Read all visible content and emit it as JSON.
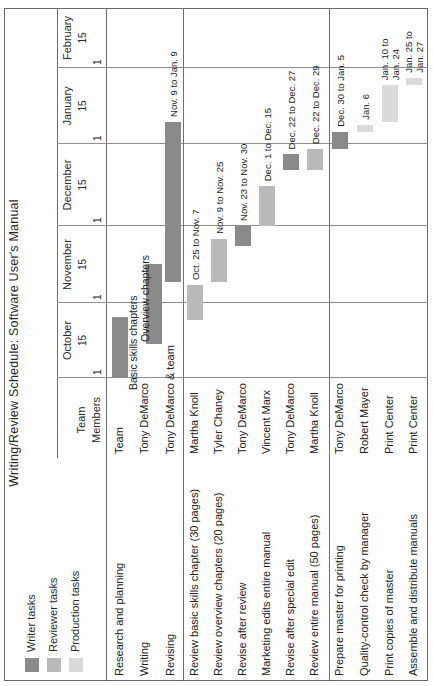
{
  "chart_data": {
    "type": "bar",
    "variant": "rotated-gantt",
    "orientation": "page rotated 90 degrees counterclockwise",
    "title": "Writing/Review Schedule: Software User's Manual",
    "legend": [
      {
        "label": "Writer tasks",
        "type": "writer"
      },
      {
        "label": "Reviewer tasks",
        "type": "reviewer"
      },
      {
        "label": "Production tasks",
        "type": "production"
      }
    ],
    "colors": {
      "writer": "#8a8a8a",
      "reviewer": "#b9b9b9",
      "production": "#dadada"
    },
    "team_header_lines": [
      "Team",
      "Members"
    ],
    "axis": {
      "months": [
        {
          "name": "October",
          "first_tick": "1",
          "mid_tick": "15"
        },
        {
          "name": "November",
          "first_tick": "1",
          "mid_tick": "15"
        },
        {
          "name": "December",
          "first_tick": "1",
          "mid_tick": "15"
        },
        {
          "name": "January",
          "first_tick": "1",
          "mid_tick": "15"
        },
        {
          "name": "February",
          "first_tick": "1",
          "mid_tick": "15"
        }
      ]
    },
    "sections": [
      {
        "name": "writer-tasks",
        "tasks": [
          {
            "task": "Research and planning",
            "member": "Team",
            "type": "writer",
            "start": "Oct 1",
            "end": "Oct 25",
            "bar_labels": []
          },
          {
            "task": "Writing",
            "member": "Tony DeMarco",
            "type": "writer",
            "start": "Oct 15",
            "end": "Nov 15",
            "bar_labels": [],
            "labels_above": [
              "Basic skills chapters",
              "Overview chapters"
            ]
          },
          {
            "task": "Revising",
            "member": "Tony DeMarco & team",
            "type": "writer",
            "start": "Nov 9",
            "end": "Jan 9",
            "bar_labels": [
              "Nov. 9 to Jan. 9"
            ]
          }
        ]
      },
      {
        "name": "review-tasks",
        "tasks": [
          {
            "task": "Review basic skills chapter (30 pages)",
            "member": "Martha Knoll",
            "type": "reviewer",
            "start": "Oct 25",
            "end": "Nov 7",
            "bar_labels": [
              "Oct. 25 to Nov. 7"
            ]
          },
          {
            "task": "Review overview chapters (20 pages)",
            "member": "Tyler Chaney",
            "type": "reviewer",
            "start": "Nov 9",
            "end": "Nov 25",
            "bar_labels": [
              "Nov. 9 to Nov. 25"
            ]
          },
          {
            "task": "Revise after review",
            "member": "Tony DeMarco",
            "type": "writer",
            "start": "Nov 23",
            "end": "Nov 30",
            "bar_labels": [
              "Nov. 23 to Nov. 30"
            ]
          },
          {
            "task": "Marketing edits entire manual",
            "member": "Vincent Marx",
            "type": "reviewer",
            "start": "Dec 1",
            "end": "Dec 15",
            "bar_labels": [
              "Dec. 1 to Dec. 15"
            ]
          },
          {
            "task": "Revise after special edit",
            "member": "Tony DeMarco",
            "type": "writer",
            "start": "Dec 22",
            "end": "Dec 27",
            "bar_labels": [
              "Dec. 22 to Dec. 27"
            ]
          },
          {
            "task": "Review entire manual (50 pages)",
            "member": "Martha Knoll",
            "type": "reviewer",
            "start": "Dec 22",
            "end": "Dec 29",
            "bar_labels": [
              "Dec. 22 to Dec. 29"
            ]
          }
        ]
      },
      {
        "name": "production-tasks",
        "tasks": [
          {
            "task": "Prepare master for printing",
            "member": "Tony DeMarco",
            "type": "writer",
            "start": "Dec 30",
            "end": "Jan 5",
            "bar_labels": [
              "Dec. 30 to Jan. 5"
            ]
          },
          {
            "task": "Quality-control check by manager",
            "member": "Robert Mayer",
            "type": "production",
            "start": "Jan 6",
            "end": "Jan 6",
            "bar_labels": [
              "Jan. 6"
            ]
          },
          {
            "task": "Print copies of master",
            "member": "Print Center",
            "type": "production",
            "start": "Jan 10",
            "end": "Jan 24",
            "bar_labels": [
              "Jan. 10 to",
              "Jan. 24"
            ]
          },
          {
            "task": "Assemble and distribute manuals",
            "member": "Print Center",
            "type": "production",
            "start": "Jan 25",
            "end": "Jan 27",
            "bar_labels": [
              "Jan. 25 to",
              "Jan. 27"
            ]
          }
        ]
      }
    ]
  }
}
